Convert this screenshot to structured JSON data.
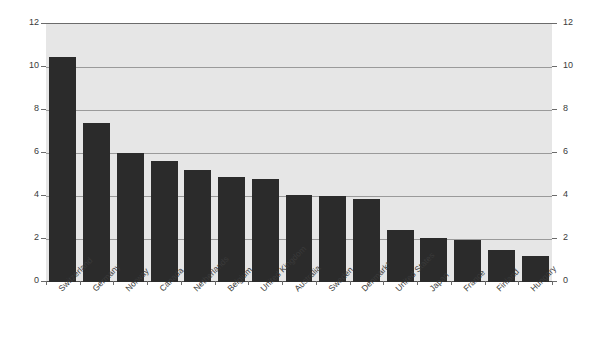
{
  "chart_data": {
    "type": "bar",
    "title": "",
    "subtitle": "",
    "xlabel": "",
    "ylabel": "",
    "categories": [
      "Switzerland",
      "Germany",
      "Norway",
      "Canada",
      "Netherlands",
      "Belgium",
      "United Kingdom",
      "Australia",
      "Sweden",
      "Denmark*",
      "United States",
      "Japan",
      "France",
      "Finland",
      "Hungary"
    ],
    "values": [
      10.45,
      7.4,
      6.0,
      5.65,
      5.2,
      4.9,
      4.8,
      4.05,
      4.0,
      3.85,
      2.4,
      2.05,
      1.95,
      1.5,
      1.2
    ],
    "ylim": [
      0,
      12
    ],
    "yticks": [
      0,
      2,
      4,
      6,
      8,
      10,
      12
    ],
    "ytick_labels": [
      "0",
      "2",
      "4",
      "6",
      "8",
      "10",
      "12"
    ],
    "right_axis": true,
    "right_ytick_labels": [
      "0",
      "2",
      "4",
      "6",
      "8",
      "10",
      "12"
    ],
    "grid": true,
    "legend": "none",
    "annotations": [],
    "colors": {
      "bar_fill": "#2b2b2b",
      "plot_background": "#e6e6e6",
      "gridline": "#9a9a9a",
      "axis_line": "#6b6b6b",
      "baseline": "#4d4d4d",
      "tick_label": "#3a3a3a",
      "page_background": "#ffffff"
    }
  }
}
